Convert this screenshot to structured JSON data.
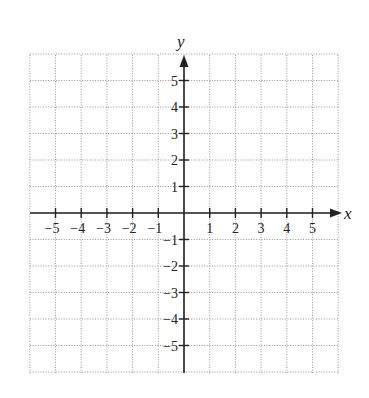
{
  "chart_data": {
    "type": "scatter",
    "title": "",
    "xlabel": "x",
    "ylabel": "y",
    "xlim": [
      -6,
      6
    ],
    "ylim": [
      -6,
      6
    ],
    "grid": true,
    "grid_style": "dotted",
    "x_ticks": [
      -5,
      -4,
      -3,
      -2,
      -1,
      1,
      2,
      3,
      4,
      5
    ],
    "y_ticks": [
      5,
      4,
      3,
      2,
      1,
      -1,
      -2,
      -3,
      -4,
      -5
    ],
    "x_tick_labels": [
      "−5",
      "−4",
      "−3",
      "−2",
      "−1",
      "1",
      "2",
      "3",
      "4",
      "5"
    ],
    "y_tick_labels": [
      "5",
      "4",
      "3",
      "2",
      "1",
      "−1",
      "−2",
      "−3",
      "−4",
      "−5"
    ],
    "series": []
  },
  "axes": {
    "x_label": "x",
    "y_label": "y",
    "arrow_color": "#222222",
    "grid_color": "#8a8a8a"
  }
}
